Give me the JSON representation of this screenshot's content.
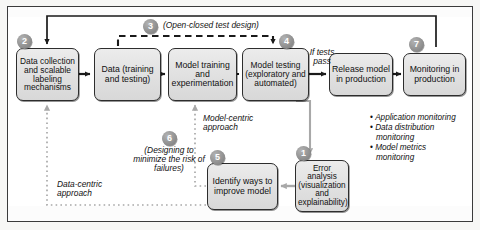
{
  "diagram": {
    "colors": {
      "node_fill": "#e2e2e2",
      "node_border": "#2d2d2d",
      "badge_fill": "#8e8e8e",
      "badge_text": "#ffffff",
      "solid_arrow": "#1a1a1a",
      "dashed_arrow": "#1a1a1a",
      "dotted_arrow": "#a8a8a8",
      "frame_border": "#3b3b3b",
      "page_background": "#ffffff"
    },
    "nodes": [
      {
        "id": "data-collection",
        "badge": "2",
        "label": "Data collection and scalable labeling mechanisms"
      },
      {
        "id": "data",
        "badge": "",
        "label": "Data (training and testing)"
      },
      {
        "id": "model-training",
        "badge": "",
        "label": "Model training and experimentation"
      },
      {
        "id": "model-testing",
        "badge": "4",
        "label": "Model testing (exploratory and automated)"
      },
      {
        "id": "release-model",
        "badge": "",
        "label": "Release model in production"
      },
      {
        "id": "monitoring",
        "badge": "7",
        "label": "Monitoring in production"
      },
      {
        "id": "identify-ways",
        "badge": "5",
        "label": "Identify ways to improve model"
      },
      {
        "id": "error-analysis",
        "badge": "1",
        "label": "Error analysis (visualization and explainability)"
      }
    ],
    "annotations": [
      {
        "id": "open-closed",
        "badge": "3",
        "text": "(Open-closed test design)"
      },
      {
        "id": "if-tests-pass",
        "badge": "",
        "text": "If tests pass"
      },
      {
        "id": "model-centric",
        "badge": "",
        "text": "Model-centric approach"
      },
      {
        "id": "designing",
        "badge": "6",
        "text": "(Designing to minimize the risk of failures)"
      },
      {
        "id": "data-centric",
        "badge": "",
        "text": "Data-centric approach"
      }
    ],
    "monitoring_list": [
      "Application monitoring",
      "Data distribution monitoring",
      "Model metrics monitoring"
    ]
  }
}
